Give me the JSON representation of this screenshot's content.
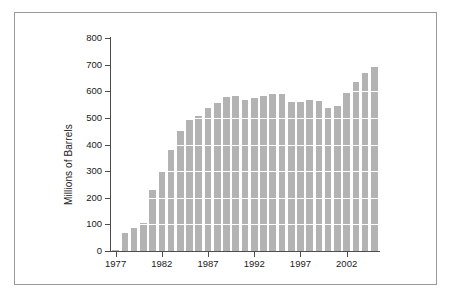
{
  "figure": {
    "background_color": "#ffffff",
    "frame_color": "#9a9a9a",
    "axis_color": "#4d4d4d",
    "bar_color": "#b3b3b3",
    "gridline_color": "#ffffff"
  },
  "chart_data": {
    "type": "bar",
    "title": "",
    "xlabel": "",
    "ylabel": "Millions of Barrels",
    "ylim": [
      0,
      800
    ],
    "yticks": [
      0,
      100,
      200,
      300,
      400,
      500,
      600,
      700,
      800
    ],
    "ytick_labels": [
      "0",
      "100",
      "200",
      "300",
      "400",
      "500",
      "600",
      "700",
      "800"
    ],
    "xtick_labels": [
      "1977",
      "1982",
      "1987",
      "1992",
      "1997",
      "2002"
    ],
    "xticks": [
      1977,
      1982,
      1987,
      1992,
      1997,
      2002
    ],
    "xlim": [
      1976.5,
      2005.5
    ],
    "grid": "horizontal-white-over-bars",
    "legend": null,
    "categories": [
      "1977",
      "1978",
      "1979",
      "1980",
      "1981",
      "1982",
      "1983",
      "1984",
      "1985",
      "1986",
      "1987",
      "1988",
      "1989",
      "1990",
      "1991",
      "1992",
      "1993",
      "1994",
      "1995",
      "1996",
      "1997",
      "1998",
      "1999",
      "2000",
      "2001",
      "2002",
      "2003",
      "2004",
      "2005"
    ],
    "values": [
      5,
      68,
      88,
      105,
      230,
      295,
      378,
      450,
      492,
      508,
      537,
      556,
      578,
      583,
      567,
      573,
      583,
      588,
      588,
      561,
      560,
      567,
      563,
      537,
      546,
      595,
      634,
      670,
      690
    ]
  }
}
